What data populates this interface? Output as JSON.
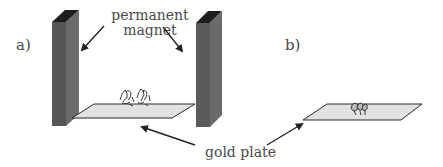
{
  "panels": {
    "a": {
      "label": "a)"
    },
    "b": {
      "label": "b)"
    }
  },
  "annotations": {
    "magnet_line1": "permanent",
    "magnet_line2": "magnet",
    "plate": "gold plate"
  },
  "colors": {
    "magnet_front": "#555555",
    "magnet_side": "#6a6a6a",
    "magnet_top": "#1e1e1e",
    "plate_fill": "#e2e2e2",
    "plate_edge": "#2a2a2a",
    "arrow": "#222222",
    "text": "#4a4a4a"
  }
}
